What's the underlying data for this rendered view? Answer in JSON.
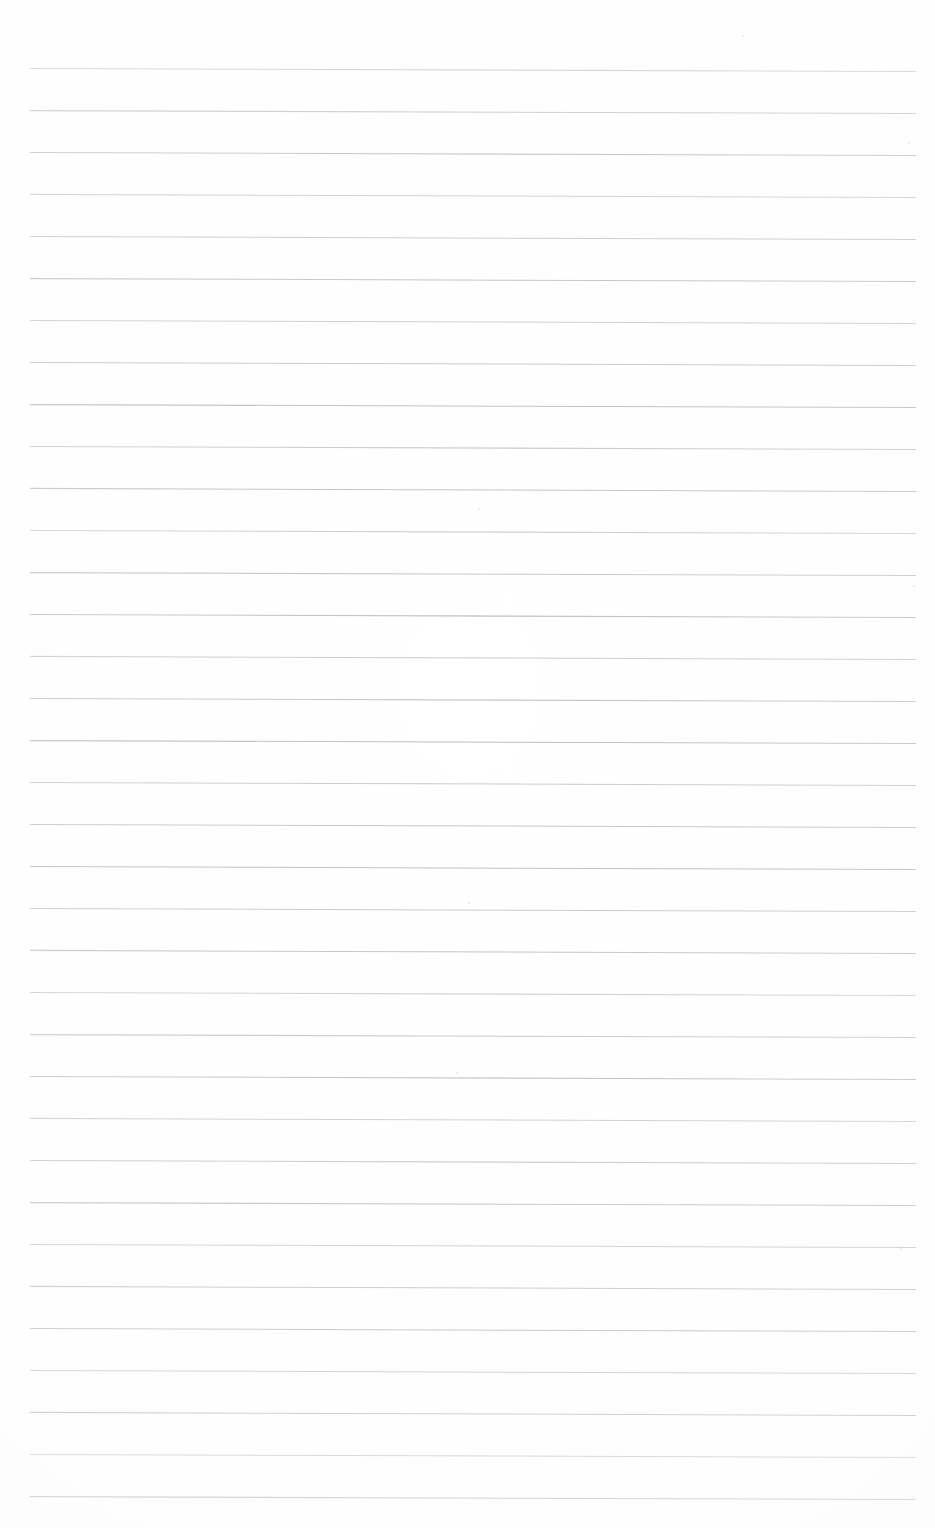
{
  "document": {
    "kind": "scanned-document",
    "title": "Blank Lined Notepad Page",
    "description": "Scanned blank ruled writing paper with horizontal rule lines and no written content",
    "page_width_px": 935,
    "page_height_px": 1528,
    "background_color": "#ffffff",
    "text_content": "",
    "has_text": false,
    "has_handwriting": false
  },
  "ruling": {
    "line_color": "#b9bac0",
    "line_count": 35,
    "first_line_y": 68,
    "line_spacing_px": 42,
    "left_margin_x": 30,
    "right_margin_x": 916,
    "stroke_width_px": 1.05,
    "slope_note": "lines drift downward ~3px from left edge to right edge (scan skew)",
    "line_positions_y": [
      68,
      110,
      152,
      194,
      236,
      278,
      320,
      362,
      404,
      446,
      488,
      530,
      572,
      614,
      656,
      698,
      740,
      782,
      824,
      866,
      908,
      950,
      992,
      1034,
      1076,
      1118,
      1160,
      1202,
      1244,
      1286,
      1328,
      1370,
      1412,
      1454,
      1496
    ]
  },
  "marks": {
    "specks": [
      {
        "x": 742,
        "y": 35,
        "size": 2
      },
      {
        "x": 908,
        "y": 142,
        "size": 2
      },
      {
        "x": 478,
        "y": 508,
        "size": 2
      },
      {
        "x": 913,
        "y": 585,
        "size": 2
      },
      {
        "x": 468,
        "y": 902,
        "size": 2
      },
      {
        "x": 456,
        "y": 1072,
        "size": 2
      },
      {
        "x": 900,
        "y": 1248,
        "size": 2
      }
    ]
  }
}
